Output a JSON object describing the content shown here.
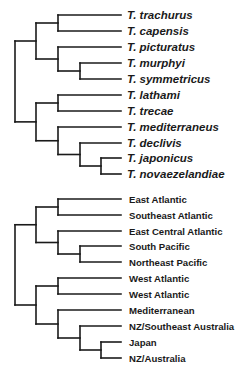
{
  "diagram": {
    "type": "phylogenetic-trees",
    "line_color": "#1a1a1a",
    "trees": [
      {
        "name": "species-tree",
        "label_style": "species",
        "leaves": [
          {
            "label": "T. trachurus",
            "y": 15
          },
          {
            "label": "T. capensis",
            "y": 31
          },
          {
            "label": "T. picturatus",
            "y": 47
          },
          {
            "label": "T. murphyi",
            "y": 63
          },
          {
            "label": "T. symmetricus",
            "y": 79
          },
          {
            "label": "T. lathami",
            "y": 95
          },
          {
            "label": "T. trecae",
            "y": 111
          },
          {
            "label": "T. mediterraneus",
            "y": 127
          },
          {
            "label": "T. declivis",
            "y": 143
          },
          {
            "label": "T. japonicus",
            "y": 158
          },
          {
            "label": "T. novaezelandiae",
            "y": 174
          }
        ],
        "tip_x": 121,
        "label_x": 127,
        "topology": "(((0,1),(2,(3,4))),((5,6),(7,(8,(9,10)))))"
      },
      {
        "name": "region-tree",
        "label_style": "region",
        "leaves": [
          {
            "label": "East Atlantic",
            "y": 199
          },
          {
            "label": "Southeast Atlantic",
            "y": 215
          },
          {
            "label": "East Central Atlantic",
            "y": 231
          },
          {
            "label": "South Pacific",
            "y": 246
          },
          {
            "label": "Northeast Pacific",
            "y": 262
          },
          {
            "label": "West Atlantic",
            "y": 278
          },
          {
            "label": "West Atlantic",
            "y": 294
          },
          {
            "label": "Mediterranean",
            "y": 310
          },
          {
            "label": "NZ/Southeast Australia",
            "y": 326
          },
          {
            "label": "Japan",
            "y": 342
          },
          {
            "label": "NZ/Australia",
            "y": 358
          }
        ],
        "tip_x": 121,
        "label_x": 129,
        "topology": "(((0,1),(2,(3,4))),((5,6),(7,(8,(9,10)))))"
      }
    ],
    "node_x_levels": [
      15,
      36,
      58,
      80,
      101
    ]
  }
}
